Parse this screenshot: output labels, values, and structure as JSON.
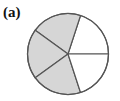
{
  "figure": {
    "label": "(a)",
    "circle": {
      "cx": 68,
      "cy": 54,
      "r": 40.5,
      "stroke": "#555555",
      "stroke_width": 1.2
    },
    "slices": {
      "total": 5,
      "start_angle_deg": 0,
      "shaded_indices": [
        1,
        2,
        3
      ],
      "shaded_count": 3,
      "fill_shaded": "#d6d6d6",
      "fill_unshaded": "#ffffff"
    }
  }
}
